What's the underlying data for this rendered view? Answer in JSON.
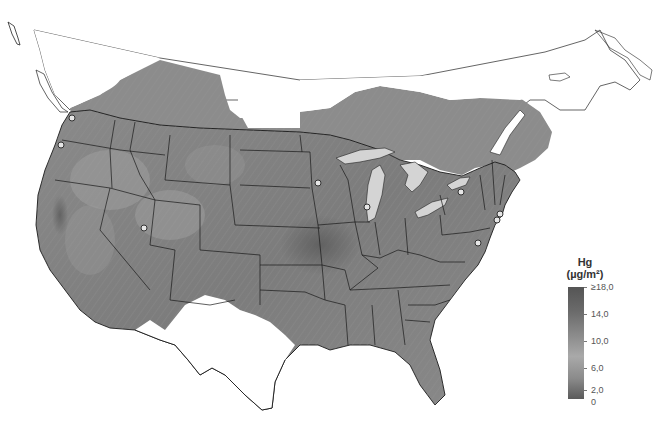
{
  "map": {
    "description": "Map of contiguous United States showing mercury (Hg) deposition, grayscale shaded, with state boundaries, Great Lakes, and monitoring sites",
    "colors": {
      "background": "#ffffff",
      "land_unshaded": "#ffffff",
      "shaded_high": "#555555",
      "shaded_mid": "#8e8e8e",
      "shaded_low": "#b0b0b0",
      "lakes": "#d4d4d4",
      "borders": "#222222",
      "site_marker_fill": "#e6e6e6"
    },
    "site_markers": [
      {
        "name": "seattle-area",
        "x": 72,
        "y": 118
      },
      {
        "name": "oregon-coast",
        "x": 61,
        "y": 145
      },
      {
        "name": "utah",
        "x": 144,
        "y": 228
      },
      {
        "name": "minnesota",
        "x": 318,
        "y": 183
      },
      {
        "name": "chicago",
        "x": 367,
        "y": 207
      },
      {
        "name": "lake-ontario",
        "x": 461,
        "y": 192
      },
      {
        "name": "new-york",
        "x": 500,
        "y": 214
      },
      {
        "name": "new-jersey",
        "x": 497,
        "y": 220
      },
      {
        "name": "maryland",
        "x": 478,
        "y": 243
      }
    ]
  },
  "legend": {
    "title": "Hg",
    "unit": "(µg/m²)",
    "labels": [
      {
        "text": "≥18,0",
        "position": 0.0
      },
      {
        "text": "14,0",
        "position": 0.24
      },
      {
        "text": "10,0",
        "position": 0.48
      },
      {
        "text": "6,0",
        "position": 0.72
      },
      {
        "text": "2,0",
        "position": 0.92
      },
      {
        "text": "0",
        "position": 1.0
      }
    ]
  }
}
